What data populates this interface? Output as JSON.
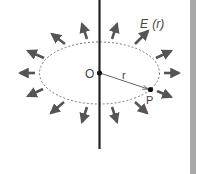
{
  "diagram": {
    "field_label": "E (r)",
    "field_label_main": "E",
    "field_label_arg": "(r)",
    "origin_label": "O",
    "point_label": "P",
    "radius_label": "r",
    "colors": {
      "line": "#222222",
      "arrow": "#555555",
      "ellipse": "#777777",
      "side_bar": "#a9a9a9",
      "text": "#444444"
    }
  }
}
